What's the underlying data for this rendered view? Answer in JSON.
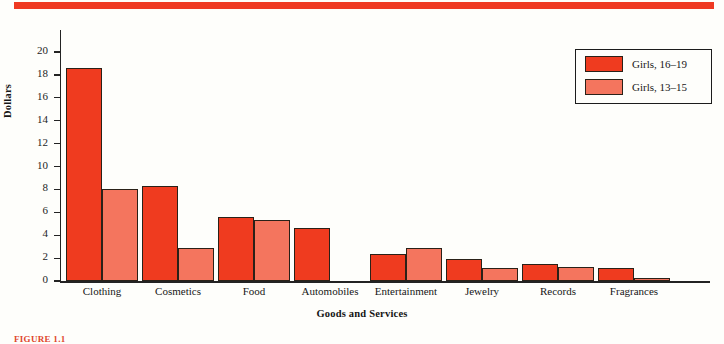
{
  "chart_data": {
    "type": "bar",
    "title": "",
    "xlabel": "Goods and Services",
    "ylabel": "Dollars",
    "ylim": [
      0,
      20
    ],
    "ytick_step": 2,
    "yticks": [
      0,
      2,
      4,
      6,
      8,
      10,
      12,
      14,
      16,
      18,
      20
    ],
    "grid": false,
    "legend_position": "top-right",
    "categories": [
      "Clothing",
      "Cosmetics",
      "Food",
      "Automobiles",
      "Entertainment",
      "Jewelry",
      "Records",
      "Fragrances"
    ],
    "series": [
      {
        "name": "Girls, 16–19",
        "color": "#ef3b1f",
        "values": [
          18.6,
          8.3,
          5.6,
          4.6,
          2.4,
          1.9,
          1.5,
          1.1
        ]
      },
      {
        "name": "Girls, 13–15",
        "color": "#f4755e",
        "values": [
          8.0,
          2.9,
          5.3,
          0,
          2.9,
          1.1,
          1.2,
          0.3
        ]
      }
    ]
  },
  "axes": {
    "ylabel": "Dollars",
    "xlabel": "Goods and Services",
    "ytick_labels": [
      "0",
      "2",
      "4",
      "6",
      "8",
      "10",
      "12",
      "14",
      "16",
      "18",
      "20"
    ],
    "xtick_labels": [
      "Clothing",
      "Cosmetics",
      "Food",
      "Automobiles",
      "Entertainment",
      "Jewelry",
      "Records",
      "Fragrances"
    ]
  },
  "legend": {
    "entries": [
      {
        "label": "Girls, 16–19",
        "color": "#ef3b1f"
      },
      {
        "label": "Girls, 13–15",
        "color": "#f4755e"
      }
    ]
  },
  "decoration": {
    "top_rule_color": "#ef3a22",
    "background_color": "#fefefb",
    "caption": "FIGURE 1.1"
  }
}
